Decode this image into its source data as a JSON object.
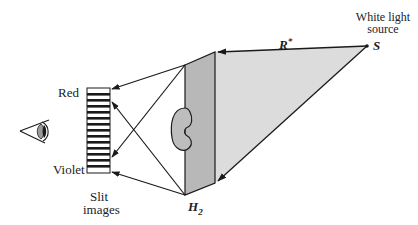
{
  "labels": {
    "red": "Red",
    "violet": "Violet",
    "slit_images_line1": "Slit",
    "slit_images_line2": "images",
    "hologram": "H",
    "hologram_sub": "2",
    "reference": "R",
    "reference_sup": "*",
    "source": "S",
    "source_desc_line1": "White light",
    "source_desc_line2": "source"
  },
  "icons": {
    "eye": "eye-icon"
  },
  "colors": {
    "line": "#1a1a1a",
    "plate_fill": "#b8b8b8",
    "beam_fill": "#dcdcdc",
    "object_fill": "#bdbdbd",
    "background": "#ffffff"
  },
  "slit_stripes": 13
}
